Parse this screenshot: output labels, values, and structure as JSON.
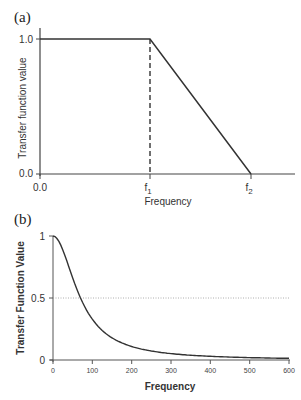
{
  "chart_data": [
    {
      "panel": "(a)",
      "type": "line",
      "title": "",
      "xlabel": "Frequency",
      "ylabel": "Transfer function value",
      "x_ticks": [
        "0.0",
        "f1",
        "f2"
      ],
      "y_ticks": [
        "0.0",
        "1.0"
      ],
      "series": [
        {
          "name": "transfer function",
          "points": [
            {
              "x": "0.0",
              "y": 1.0
            },
            {
              "x": "f1",
              "y": 1.0
            },
            {
              "x": "f2",
              "y": 0.0
            }
          ]
        }
      ],
      "annotations": [
        {
          "type": "dashed-vertical-line",
          "x": "f1",
          "from_y": 0.0,
          "to_y": 1.0
        }
      ],
      "ylim": [
        0.0,
        1.0
      ],
      "grid": false
    },
    {
      "panel": "(b)",
      "type": "line",
      "title": "",
      "xlabel": "Frequency",
      "ylabel": "Transfer Function Value",
      "x_ticks": [
        "0",
        "100",
        "200",
        "300",
        "400",
        "500",
        "600"
      ],
      "y_ticks": [
        "0",
        "0.5",
        "1"
      ],
      "series": [
        {
          "name": "transfer function",
          "x": [
            0,
            25,
            50,
            70,
            100,
            150,
            200,
            300,
            400,
            500,
            600
          ],
          "values": [
            1.0,
            0.89,
            0.66,
            0.5,
            0.33,
            0.18,
            0.11,
            0.05,
            0.03,
            0.02,
            0.013
          ]
        }
      ],
      "annotations": [
        {
          "type": "dotted-horizontal-line",
          "y": 0.5
        }
      ],
      "xlim": [
        0,
        600
      ],
      "ylim": [
        0,
        1
      ],
      "grid": false
    }
  ],
  "labels": {
    "panel_a": "(a)",
    "panel_b": "(b)",
    "a_xlabel": "Frequency",
    "a_ylabel": "Transfer function value",
    "a_y_top": "1.0",
    "a_y_bottom": "0.0",
    "a_x_origin": "0.0",
    "a_f1": "f",
    "a_f1_sub": "1",
    "a_f2": "f",
    "a_f2_sub": "2",
    "b_xlabel": "Frequency",
    "b_ylabel": "Transfer Function Value",
    "b_y_ticks": [
      "0",
      "0.5",
      "1"
    ],
    "b_x_ticks": [
      "0",
      "100",
      "200",
      "300",
      "400",
      "500",
      "600"
    ]
  },
  "colors": {
    "line": "#333333",
    "axis": "#444444",
    "dotted": "#999999"
  }
}
